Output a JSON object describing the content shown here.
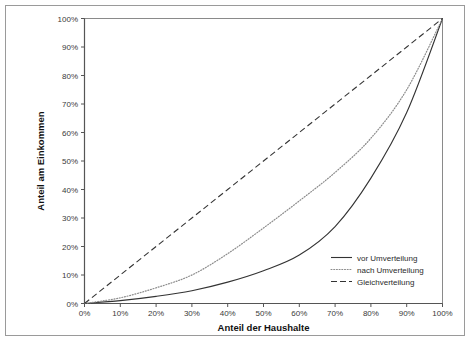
{
  "chart_data": {
    "type": "line",
    "title": "",
    "xlabel": "Anteil der Haushalte",
    "ylabel": "Anteil am Einkommen",
    "xlim": [
      0,
      100
    ],
    "ylim": [
      0,
      100
    ],
    "grid": false,
    "legend_position": "bottom-right",
    "x_tick_labels": [
      "0%",
      "10%",
      "20%",
      "30%",
      "40%",
      "50%",
      "60%",
      "70%",
      "80%",
      "90%",
      "100%"
    ],
    "y_tick_labels": [
      "0%",
      "10%",
      "20%",
      "30%",
      "40%",
      "50%",
      "60%",
      "70%",
      "80%",
      "90%",
      "100%"
    ],
    "x": [
      0,
      10,
      20,
      30,
      40,
      50,
      60,
      70,
      80,
      90,
      100
    ],
    "series": [
      {
        "name": "vor Umverteilung",
        "style": "solid",
        "color": "#333333",
        "values": [
          0,
          1,
          2.5,
          4.5,
          7.5,
          11.5,
          17,
          27,
          44,
          67,
          100
        ]
      },
      {
        "name": "nach Umverteilung",
        "style": "dotted",
        "color": "#8c8c8c",
        "values": [
          0,
          2,
          5.5,
          10,
          17.5,
          26.5,
          36,
          46,
          58,
          75,
          100
        ]
      },
      {
        "name": "Gleichverteilung",
        "style": "dashed",
        "color": "#333333",
        "values": [
          0,
          10,
          20,
          30,
          40,
          50,
          60,
          70,
          80,
          90,
          100
        ]
      }
    ]
  },
  "axes": {
    "x_title": "Anteil der Haushalte",
    "y_title": "Anteil am Einkommen",
    "x_ticks": [
      "0%",
      "10%",
      "20%",
      "30%",
      "40%",
      "50%",
      "60%",
      "70%",
      "80%",
      "90%",
      "100%"
    ],
    "y_ticks": [
      "100%",
      "90%",
      "80%",
      "70%",
      "60%",
      "50%",
      "40%",
      "30%",
      "20%",
      "10%",
      "0%"
    ]
  },
  "legend": {
    "items": [
      {
        "label": "vor Umverteilung",
        "style": "solid"
      },
      {
        "label": "nach Umverteilung",
        "style": "dotted"
      },
      {
        "label": "Gleichverteilung",
        "style": "dashed"
      }
    ]
  },
  "colors": {
    "frame": "#9a9a9a",
    "axis": "#555555",
    "solid_line": "#333333",
    "dotted_line": "#8c8c8c",
    "dashed_line": "#333333",
    "background": "#ffffff"
  }
}
